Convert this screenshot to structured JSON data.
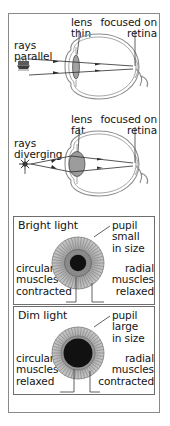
{
  "figure": {
    "colors": {
      "ray": "#2b2b2b",
      "eye_outline": "#8c8c8c",
      "lens_fill": "#9c9c9c",
      "pupil": "#111111",
      "iris_outer": "#b9b9b9",
      "iris_inner": "#8f8f8f",
      "frame": "#8a8a8a",
      "text": "#141414"
    }
  },
  "accommodation": {
    "distant": {
      "rays_label": "rays\nparallel",
      "lens_label": "lens\nthin",
      "focus_label": "focused on\nretina",
      "object_icon": "distant-ship-icon"
    },
    "near": {
      "rays_label": "rays\ndiverging",
      "lens_label": "lens\nfat",
      "focus_label": "focused on\nretina",
      "object_icon": "near-flower-icon"
    }
  },
  "pupil_reflex": {
    "bright": {
      "title": "Bright light",
      "pupil_label": "pupil\nsmall\nin size",
      "circular_label": "circular\nmuscles\ncontracted",
      "radial_label": "radial\nmuscles\nrelaxed"
    },
    "dim": {
      "title": "Dim light",
      "pupil_label": "pupil\nlarge\nin size",
      "circular_label": "circular\nmuscles\nrelaxed",
      "radial_label": "radial\nmuscles\ncontracted"
    }
  }
}
